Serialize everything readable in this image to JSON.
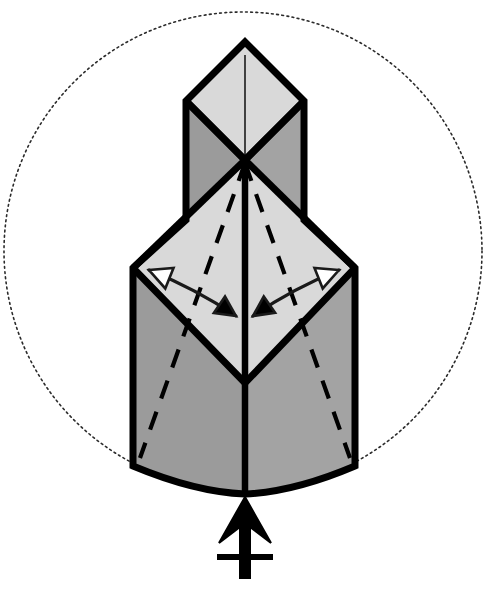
{
  "figure": {
    "kind": "origami-diagram",
    "canvas": {
      "width": 488,
      "height": 594,
      "background": "#ffffff"
    },
    "colors": {
      "paper_light": "#d9d9d9",
      "paper_dark": "#9b9b9b",
      "paper_dark_alt": "#a3a3a3",
      "outline": "#000000",
      "crease_dashed": "#000000",
      "arrow_stroke": "#1a1a1a",
      "arrow_fill_hollow": "#ffffff",
      "arrow_fill_solid": "#000000",
      "guide_circle": "#2b2b2b",
      "background": "#ffffff"
    },
    "guide_circle": {
      "name": "dotted-bounding-circle",
      "center_x": 243,
      "center_y": 251,
      "radius": 239,
      "stroke_width": 1.6,
      "dash_pattern": "1.8 3.4"
    },
    "model": {
      "apex": {
        "x": 245,
        "y": 42
      },
      "top_diamond": {
        "top": {
          "x": 245,
          "y": 42
        },
        "left": {
          "x": 186,
          "y": 101
        },
        "right": {
          "x": 304,
          "y": 101
        },
        "bottom": {
          "x": 245,
          "y": 160
        }
      },
      "center_vertex": {
        "x": 245,
        "y": 160
      },
      "upper_column": {
        "left_x": 186,
        "right_x": 304,
        "top_y": 101,
        "bottom_y": 220
      },
      "mid_diamond": {
        "top": {
          "x": 245,
          "y": 160
        },
        "left": {
          "x": 133,
          "y": 268
        },
        "right": {
          "x": 355,
          "y": 268
        },
        "bottom": {
          "x": 245,
          "y": 383
        }
      },
      "lower_body": {
        "left_x": 133,
        "right_x": 355,
        "top_y": 268,
        "side_bottom_y": 466,
        "center_bottom_y": 494
      },
      "center_spine_top": {
        "x": 245,
        "y": 55
      },
      "center_spine_bottom": {
        "x": 245,
        "y": 494
      }
    },
    "creases": [
      {
        "name": "crease-left-inner",
        "from": {
          "x": 245,
          "y": 163
        },
        "to": {
          "x": 140,
          "y": 458
        }
      },
      {
        "name": "crease-right-inner",
        "from": {
          "x": 245,
          "y": 163
        },
        "to": {
          "x": 350,
          "y": 458
        }
      }
    ],
    "arrows": [
      {
        "name": "fold-arrow-left",
        "direction": "outer-left-vertex-to-inner-center",
        "tail_head": "hollow-triangle",
        "tip_head": "solid-triangle",
        "tail": {
          "x": 149,
          "y": 270
        },
        "control": {
          "x": 196,
          "y": 289
        },
        "tip": {
          "x": 236,
          "y": 316
        }
      },
      {
        "name": "fold-arrow-right",
        "direction": "outer-right-vertex-to-inner-center",
        "tail_head": "hollow-triangle",
        "tip_head": "solid-triangle",
        "tail": {
          "x": 339,
          "y": 270
        },
        "control": {
          "x": 292,
          "y": 289
        },
        "tip": {
          "x": 253,
          "y": 316
        }
      }
    ],
    "repeat_symbol": {
      "name": "repeat-behind-symbol",
      "description": "Solid arrow pointing up into the model with a single crossbar on its tail, meaning repeat this step behind",
      "arrow_tip": {
        "x": 245,
        "y": 497
      },
      "tail_end": {
        "x": 245,
        "y": 578
      },
      "crossbar_y": 557,
      "crossbar_half_width": 28
    },
    "annotations": {
      "light_face_label": "white / unprinted side of paper",
      "dark_face_label": "colored side of paper",
      "dashed_label": "valley crease (hidden layer)",
      "arrow_label": "fold flaps inward to the center line"
    }
  }
}
